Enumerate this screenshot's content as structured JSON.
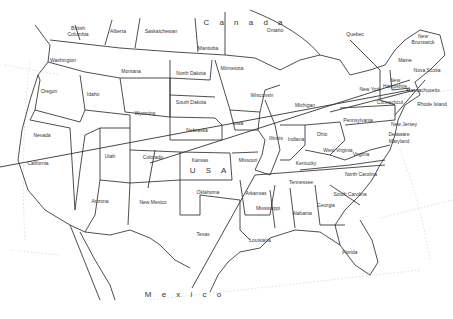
{
  "map": {
    "title": "Outline map of the United States",
    "countries": [
      {
        "label": "C a n a d a",
        "x": 245,
        "y": 23
      },
      {
        "label": "U  S  A",
        "x": 210,
        "y": 171
      },
      {
        "label": "M e x i c o",
        "x": 185,
        "y": 295
      }
    ],
    "regions": [
      {
        "label": "British Columbia",
        "x": 78,
        "y": 31
      },
      {
        "label": "Alberta",
        "x": 118,
        "y": 31
      },
      {
        "label": "Saskatchewan",
        "x": 161,
        "y": 31
      },
      {
        "label": "Manitoba",
        "x": 208,
        "y": 48
      },
      {
        "label": "Ontario",
        "x": 275,
        "y": 30
      },
      {
        "label": "Quebec",
        "x": 355,
        "y": 34
      },
      {
        "label": "New Brunswick",
        "x": 423,
        "y": 39
      },
      {
        "label": "Nova Scotia",
        "x": 427,
        "y": 70
      },
      {
        "label": "Washington",
        "x": 63,
        "y": 60
      },
      {
        "label": "Oregon",
        "x": 49,
        "y": 91
      },
      {
        "label": "Idaho",
        "x": 93,
        "y": 94
      },
      {
        "label": "Montana",
        "x": 131,
        "y": 71
      },
      {
        "label": "Wyoming",
        "x": 145,
        "y": 113
      },
      {
        "label": "North Dakota",
        "x": 191,
        "y": 73
      },
      {
        "label": "South Dakota",
        "x": 191,
        "y": 102
      },
      {
        "label": "Minnesota",
        "x": 232,
        "y": 68
      },
      {
        "label": "Wisconsin",
        "x": 262,
        "y": 95
      },
      {
        "label": "Michigan",
        "x": 305,
        "y": 105
      },
      {
        "label": "New York",
        "x": 370,
        "y": 89
      },
      {
        "label": "New Hampshire",
        "x": 395,
        "y": 83
      },
      {
        "label": "Maine",
        "x": 405,
        "y": 60
      },
      {
        "label": "Massachusetts",
        "x": 423,
        "y": 90
      },
      {
        "label": "Rhode Island",
        "x": 432,
        "y": 104
      },
      {
        "label": "Connecticut",
        "x": 390,
        "y": 102
      },
      {
        "label": "Nevada",
        "x": 42,
        "y": 135
      },
      {
        "label": "Utah",
        "x": 110,
        "y": 156
      },
      {
        "label": "Colorado",
        "x": 153,
        "y": 157
      },
      {
        "label": "Nebraska",
        "x": 197,
        "y": 130
      },
      {
        "label": "Iowa",
        "x": 238,
        "y": 123
      },
      {
        "label": "Illinois",
        "x": 276,
        "y": 138
      },
      {
        "label": "Indiana",
        "x": 296,
        "y": 139
      },
      {
        "label": "Ohio",
        "x": 322,
        "y": 134
      },
      {
        "label": "Pennsylvania",
        "x": 358,
        "y": 120
      },
      {
        "label": "New Jersey",
        "x": 404,
        "y": 124
      },
      {
        "label": "Delaware",
        "x": 399,
        "y": 134
      },
      {
        "label": "Maryland",
        "x": 399,
        "y": 141
      },
      {
        "label": "West Virginia",
        "x": 338,
        "y": 150
      },
      {
        "label": "Virginia",
        "x": 361,
        "y": 154
      },
      {
        "label": "Kentucky",
        "x": 306,
        "y": 163
      },
      {
        "label": "Missouri",
        "x": 248,
        "y": 160
      },
      {
        "label": "Kansas",
        "x": 200,
        "y": 160
      },
      {
        "label": "California",
        "x": 38,
        "y": 163
      },
      {
        "label": "Arizona",
        "x": 100,
        "y": 201
      },
      {
        "label": "New Mexico",
        "x": 153,
        "y": 202
      },
      {
        "label": "Oklahoma",
        "x": 208,
        "y": 192
      },
      {
        "label": "Arkansas",
        "x": 256,
        "y": 193
      },
      {
        "label": "Tennessee",
        "x": 301,
        "y": 182
      },
      {
        "label": "North Carolina",
        "x": 361,
        "y": 174
      },
      {
        "label": "South Carolina",
        "x": 350,
        "y": 194
      },
      {
        "label": "Mississippi",
        "x": 268,
        "y": 208
      },
      {
        "label": "Alabama",
        "x": 302,
        "y": 213
      },
      {
        "label": "Georgia",
        "x": 326,
        "y": 205
      },
      {
        "label": "Texas",
        "x": 203,
        "y": 234
      },
      {
        "label": "Louisiana",
        "x": 260,
        "y": 240
      },
      {
        "label": "Florida",
        "x": 350,
        "y": 252
      }
    ]
  }
}
